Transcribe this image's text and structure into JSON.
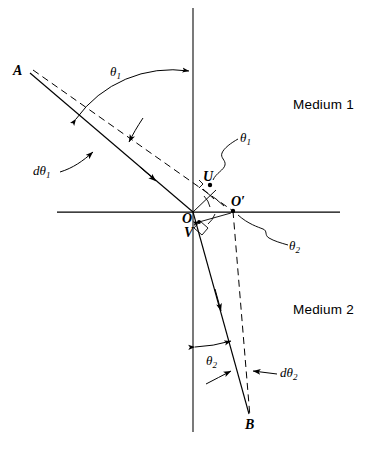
{
  "figure": {
    "background_color": "#ffffff",
    "line_color": "#000000"
  },
  "media": {
    "upper_label": "Medium 1",
    "lower_label": "Medium 2"
  },
  "points": {
    "a": "A",
    "b": "B",
    "o": "O",
    "o_prime": "O′",
    "u": "U",
    "v": "V"
  },
  "angles": {
    "theta1_incident": {
      "symbol": "θ",
      "sub": "1"
    },
    "theta1_at_u": {
      "symbol": "θ",
      "sub": "1"
    },
    "dtheta1": {
      "prefix": "d",
      "symbol": "θ",
      "sub": "1"
    },
    "theta2_refracted": {
      "symbol": "θ",
      "sub": "2"
    },
    "theta2_at_oprime": {
      "symbol": "θ",
      "sub": "2"
    },
    "dtheta2": {
      "prefix": "d",
      "symbol": "θ",
      "sub": "2"
    }
  },
  "geometry": {
    "origin": {
      "x": 193,
      "y": 212
    },
    "vertical_axis": {
      "x": 193,
      "y1": 8,
      "y2": 432
    },
    "horizontal_axis": {
      "y": 212,
      "x1": 57,
      "x2": 340
    },
    "incident_ray": {
      "from_x": 30,
      "from_y": 73,
      "to_x": 193,
      "to_y": 212
    },
    "incident_ray_dashed": {
      "from_x": 33,
      "from_y": 70,
      "to_x": 233,
      "to_y": 211
    },
    "refracted_ray": {
      "from_x": 193,
      "from_y": 212,
      "to_x": 249,
      "to_y": 414
    },
    "refracted_ray_dashed": {
      "from_x": 233,
      "from_y": 211,
      "to_x": 250,
      "to_y": 417
    },
    "u_point": {
      "x": 210,
      "y": 185
    },
    "o_prime_point": {
      "x": 233,
      "y": 211
    },
    "right_angle_mark": {
      "x": 203,
      "y": 222
    }
  }
}
